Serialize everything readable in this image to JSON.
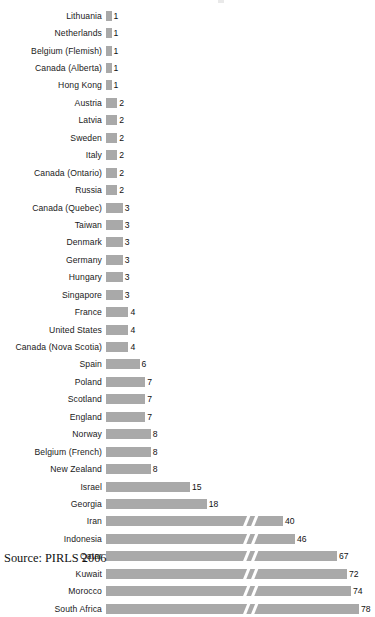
{
  "chart_data": {
    "type": "bar",
    "orientation": "horizontal",
    "title": "",
    "xlabel": "",
    "ylabel": "",
    "grid": false,
    "legend": null,
    "axis_break": {
      "present": true,
      "note": "broken axis marker on bars with values 40 and above",
      "applies_to_values_at_or_above": 40
    },
    "xlim": [
      0,
      78
    ],
    "categories": [
      "Lithuania",
      "Netherlands",
      "Belgium (Flemish)",
      "Canada (Alberta)",
      "Hong Kong",
      "Austria",
      "Latvia",
      "Sweden",
      "Italy",
      "Canada (Ontario)",
      "Russia",
      "Canada (Quebec)",
      "Taiwan",
      "Denmark",
      "Germany",
      "Hungary",
      "Singapore",
      "France",
      "United States",
      "Canada (Nova Scotia)",
      "Spain",
      "Poland",
      "Scotland",
      "England",
      "Norway",
      "Belgium (French)",
      "New Zealand",
      "Israel",
      "Georgia",
      "Iran",
      "Indonesia",
      "Qatar",
      "Kuwait",
      "Morocco",
      "South Africa"
    ],
    "values": [
      1,
      1,
      1,
      1,
      1,
      2,
      2,
      2,
      2,
      2,
      2,
      3,
      3,
      3,
      3,
      3,
      3,
      4,
      4,
      4,
      6,
      7,
      7,
      7,
      8,
      8,
      8,
      15,
      18,
      40,
      46,
      67,
      72,
      74,
      78
    ],
    "bar_color": "#a9a9a9"
  },
  "source": {
    "text": "Source: PIRLS 2006"
  }
}
